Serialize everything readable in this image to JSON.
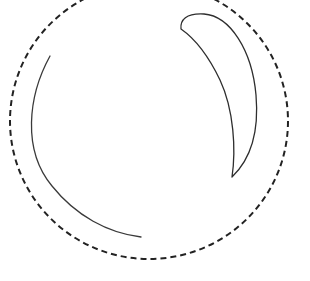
{
  "figure": {
    "width": 310,
    "height": 281,
    "background": "#ffffff",
    "shapes": {
      "dashed_circle": {
        "cx": 149,
        "cy": 121,
        "rx": 139,
        "ry": 138,
        "stroke": "#222222",
        "stroke_width": 2,
        "dasharray": "6 4"
      },
      "left_arc": {
        "path": "M 50 56 C 28 96, 22 150, 52 186 C 76 216, 108 233, 141 237",
        "stroke": "#3a3a3a",
        "stroke_width": 1.3
      },
      "crescent": {
        "path": "M 181 29 C 180 20, 186 13, 204 14 C 230 16, 252 50, 256 95 C 259 130, 252 158, 232 177 C 236 150, 234 110, 220 80 C 208 55, 194 38, 181 29 Z",
        "stroke": "#2e2e2e",
        "stroke_width": 1.3
      }
    }
  }
}
